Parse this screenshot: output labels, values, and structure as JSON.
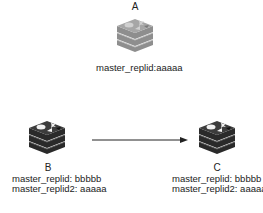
{
  "diagram": {
    "nodes": [
      {
        "id": "A",
        "label": "A",
        "style": "faded",
        "icon": "redis-stack-icon",
        "lines": [
          "master_replid:aaaaa"
        ]
      },
      {
        "id": "B",
        "label": "B",
        "style": "dark",
        "icon": "redis-stack-icon",
        "lines": [
          "master_replid: bbbbb",
          "master_replid2: aaaaa"
        ]
      },
      {
        "id": "C",
        "label": "C",
        "style": "dark",
        "icon": "redis-stack-icon",
        "lines": [
          "master_replid: bbbbb",
          "master_replid2: aaaaa"
        ]
      }
    ],
    "edges": [
      {
        "from": "B",
        "to": "C",
        "type": "arrow"
      }
    ],
    "colors": {
      "faded_top": "#a8a8a8",
      "faded_body": "#8c8c8c",
      "faded_line": "#b8b8b8",
      "dark_top": "#3a3a3a",
      "dark_body": "#2a2a2a",
      "dark_line": "#5a5a5a",
      "arrow": "#222222"
    }
  }
}
